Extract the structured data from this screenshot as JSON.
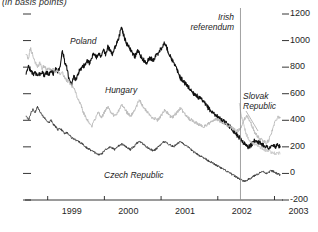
{
  "title": "(in basis points)",
  "annotations": {
    "poland": "Poland",
    "hungary": "Hungary",
    "czech": "Czech Republic",
    "slovak_line1": "Slovak",
    "slovak_line2": "Republic",
    "irish_line1": "Irish",
    "irish_line2": "referendum"
  },
  "chart_data": {
    "type": "line",
    "title": "(in basis points)",
    "xlabel": "",
    "ylabel": "",
    "ylim": [
      -200,
      1200
    ],
    "xlim": [
      1998.6,
      2003.15
    ],
    "grid": false,
    "legend": "inline-labels",
    "y_ticks": [
      1200,
      1000,
      800,
      600,
      400,
      200,
      0,
      -200
    ],
    "x_ticks": [
      1999,
      2000,
      2001,
      2002,
      2003
    ],
    "event_line": {
      "label": "Irish referendum",
      "x": 2002.4
    },
    "series": [
      {
        "name": "Poland",
        "color": "#111111",
        "width": 1.1,
        "x": [
          1998.62,
          1998.66,
          1998.7,
          1998.74,
          1998.78,
          1998.82,
          1998.86,
          1998.9,
          1998.94,
          1998.98,
          1999.02,
          1999.06,
          1999.1,
          1999.14,
          1999.18,
          1999.22,
          1999.26,
          1999.3,
          1999.34,
          1999.38,
          1999.42,
          1999.46,
          1999.5,
          1999.54,
          1999.58,
          1999.62,
          1999.66,
          1999.7,
          1999.74,
          1999.78,
          1999.82,
          1999.86,
          1999.9,
          1999.94,
          1999.98,
          2000.02,
          2000.06,
          2000.1,
          2000.14,
          2000.18,
          2000.22,
          2000.26,
          2000.3,
          2000.34,
          2000.38,
          2000.42,
          2000.46,
          2000.5,
          2000.54,
          2000.58,
          2000.62,
          2000.66,
          2000.7,
          2000.74,
          2000.78,
          2000.82,
          2000.86,
          2000.9,
          2000.94,
          2000.98,
          2001.02,
          2001.06,
          2001.1,
          2001.14,
          2001.18,
          2001.22,
          2001.26,
          2001.3,
          2001.34,
          2001.38,
          2001.42,
          2001.46,
          2001.5,
          2001.54,
          2001.58,
          2001.62,
          2001.66,
          2001.7,
          2001.74,
          2001.78,
          2001.82,
          2001.86,
          2001.9,
          2001.94,
          2001.98,
          2002.02,
          2002.06,
          2002.1,
          2002.14,
          2002.18,
          2002.22,
          2002.26,
          2002.3,
          2002.34,
          2002.38,
          2002.42,
          2002.46,
          2002.5,
          2002.54,
          2002.58,
          2002.62,
          2002.66,
          2002.7,
          2002.74,
          2002.78,
          2002.82,
          2002.86,
          2002.9,
          2002.94,
          2002.98,
          2003.02,
          2003.06,
          2003.1
        ],
        "values": [
          760,
          800,
          780,
          745,
          760,
          735,
          750,
          765,
          740,
          760,
          745,
          770,
          750,
          780,
          765,
          800,
          930,
          840,
          790,
          700,
          660,
          730,
          700,
          760,
          790,
          800,
          820,
          850,
          830,
          880,
          900,
          870,
          910,
          880,
          930,
          900,
          950,
          930,
          900,
          940,
          980,
          1030,
          1100,
          1040,
          990,
          960,
          930,
          900,
          880,
          920,
          900,
          870,
          850,
          830,
          860,
          870,
          850,
          880,
          900,
          930,
          950,
          980,
          950,
          900,
          870,
          830,
          800,
          760,
          720,
          700,
          680,
          660,
          640,
          620,
          600,
          590,
          570,
          560,
          540,
          520,
          500,
          480,
          460,
          450,
          430,
          420,
          400,
          390,
          380,
          370,
          350,
          330,
          310,
          290,
          270,
          250,
          230,
          210,
          200,
          210,
          230,
          250,
          240,
          230,
          220,
          210,
          200,
          190,
          200,
          210,
          200,
          210,
          205
        ]
      },
      {
        "name": "Hungary",
        "color": "#bdbdbd",
        "width": 1.0,
        "x": [
          1998.62,
          1998.66,
          1998.7,
          1998.74,
          1998.78,
          1998.82,
          1998.86,
          1998.9,
          1998.94,
          1998.98,
          1999.02,
          1999.06,
          1999.1,
          1999.14,
          1999.18,
          1999.22,
          1999.26,
          1999.3,
          1999.34,
          1999.38,
          1999.42,
          1999.46,
          1999.5,
          1999.54,
          1999.58,
          1999.62,
          1999.66,
          1999.7,
          1999.74,
          1999.78,
          1999.82,
          1999.86,
          1999.9,
          1999.94,
          1999.98,
          2000.02,
          2000.06,
          2000.1,
          2000.14,
          2000.18,
          2000.22,
          2000.26,
          2000.3,
          2000.34,
          2000.38,
          2000.42,
          2000.46,
          2000.5,
          2000.54,
          2000.58,
          2000.62,
          2000.66,
          2000.7,
          2000.74,
          2000.78,
          2000.82,
          2000.86,
          2000.9,
          2000.94,
          2000.98,
          2001.02,
          2001.06,
          2001.1,
          2001.14,
          2001.18,
          2001.22,
          2001.26,
          2001.3,
          2001.34,
          2001.38,
          2001.42,
          2001.46,
          2001.5,
          2001.54,
          2001.58,
          2001.62,
          2001.66,
          2001.7,
          2001.74,
          2001.78,
          2001.82,
          2001.86,
          2001.9,
          2001.94,
          2001.98,
          2002.02,
          2002.06,
          2002.1,
          2002.14,
          2002.18,
          2002.22,
          2002.26,
          2002.3,
          2002.34,
          2002.38,
          2002.42,
          2002.46,
          2002.5,
          2002.54,
          2002.58,
          2002.62,
          2002.66,
          2002.7,
          2002.74,
          2002.78,
          2002.82,
          2002.86,
          2002.9,
          2002.94,
          2002.98,
          2003.02,
          2003.06,
          2003.1
        ],
        "values": [
          900,
          860,
          950,
          880,
          840,
          800,
          830,
          790,
          810,
          780,
          800,
          770,
          790,
          760,
          780,
          740,
          760,
          720,
          700,
          690,
          660,
          640,
          600,
          560,
          520,
          470,
          430,
          400,
          380,
          360,
          400,
          430,
          460,
          420,
          440,
          480,
          500,
          470,
          450,
          430,
          450,
          480,
          520,
          500,
          470,
          450,
          430,
          450,
          480,
          520,
          560,
          520,
          490,
          470,
          450,
          430,
          420,
          410,
          400,
          420,
          450,
          480,
          460,
          440,
          420,
          430,
          450,
          470,
          490,
          470,
          450,
          430,
          410,
          400,
          390,
          380,
          370,
          360,
          350,
          360,
          370,
          380,
          390,
          400,
          410,
          400,
          390,
          380,
          370,
          360,
          350,
          340,
          330,
          320,
          330,
          350,
          400,
          430,
          420,
          380,
          340,
          300,
          280,
          260,
          250,
          240,
          230,
          250,
          300,
          350,
          400,
          430,
          420
        ]
      },
      {
        "name": "Czech Republic",
        "color": "#3a3a3a",
        "width": 0.9,
        "x": [
          1998.62,
          1998.66,
          1998.7,
          1998.74,
          1998.78,
          1998.82,
          1998.86,
          1998.9,
          1998.94,
          1998.98,
          1999.02,
          1999.06,
          1999.1,
          1999.14,
          1999.18,
          1999.22,
          1999.26,
          1999.3,
          1999.34,
          1999.38,
          1999.42,
          1999.46,
          1999.5,
          1999.54,
          1999.58,
          1999.62,
          1999.66,
          1999.7,
          1999.74,
          1999.78,
          1999.82,
          1999.86,
          1999.9,
          1999.94,
          1999.98,
          2000.02,
          2000.06,
          2000.1,
          2000.14,
          2000.18,
          2000.22,
          2000.26,
          2000.3,
          2000.34,
          2000.38,
          2000.42,
          2000.46,
          2000.5,
          2000.54,
          2000.58,
          2000.62,
          2000.66,
          2000.7,
          2000.74,
          2000.78,
          2000.82,
          2000.86,
          2000.9,
          2000.94,
          2000.98,
          2001.02,
          2001.06,
          2001.1,
          2001.14,
          2001.18,
          2001.22,
          2001.26,
          2001.3,
          2001.34,
          2001.38,
          2001.42,
          2001.46,
          2001.5,
          2001.54,
          2001.58,
          2001.62,
          2001.66,
          2001.7,
          2001.74,
          2001.78,
          2001.82,
          2001.86,
          2001.9,
          2001.94,
          2001.98,
          2002.02,
          2002.06,
          2002.1,
          2002.14,
          2002.18,
          2002.22,
          2002.26,
          2002.3,
          2002.34,
          2002.38,
          2002.42,
          2002.46,
          2002.5,
          2002.54,
          2002.58,
          2002.62,
          2002.66,
          2002.7,
          2002.74,
          2002.78,
          2002.82,
          2002.86,
          2002.9,
          2002.94,
          2002.98,
          2003.02,
          2003.06,
          2003.1
        ],
        "values": [
          430,
          400,
          450,
          480,
          460,
          500,
          470,
          440,
          420,
          400,
          380,
          400,
          370,
          350,
          330,
          340,
          320,
          300,
          310,
          290,
          270,
          260,
          250,
          240,
          230,
          220,
          200,
          190,
          180,
          170,
          160,
          150,
          140,
          145,
          160,
          180,
          190,
          200,
          190,
          180,
          200,
          210,
          220,
          215,
          200,
          190,
          180,
          195,
          210,
          230,
          240,
          230,
          215,
          200,
          190,
          180,
          170,
          180,
          195,
          210,
          230,
          240,
          230,
          220,
          210,
          200,
          215,
          230,
          240,
          230,
          215,
          200,
          190,
          175,
          160,
          150,
          140,
          130,
          120,
          110,
          100,
          90,
          80,
          70,
          60,
          50,
          40,
          30,
          20,
          10,
          0,
          -10,
          -20,
          -30,
          -40,
          -50,
          -60,
          -55,
          -45,
          -35,
          -25,
          -15,
          -5,
          5,
          15,
          10,
          0,
          10,
          20,
          15,
          5,
          -5,
          -10
        ]
      },
      {
        "name": "Slovak Republic",
        "color": "#cccccc",
        "width": 1.0,
        "x": [
          2002.38,
          2002.42,
          2002.46,
          2002.5,
          2002.54,
          2002.58,
          2002.62,
          2002.66,
          2002.7,
          2002.74,
          2002.78,
          2002.82,
          2002.86,
          2002.9,
          2002.94,
          2002.98,
          2003.02,
          2003.06,
          2003.1
        ],
        "values": [
          520,
          420,
          360,
          300,
          260,
          240,
          230,
          220,
          210,
          200,
          190,
          180,
          170,
          165,
          160,
          155,
          150,
          155,
          150
        ]
      }
    ]
  }
}
